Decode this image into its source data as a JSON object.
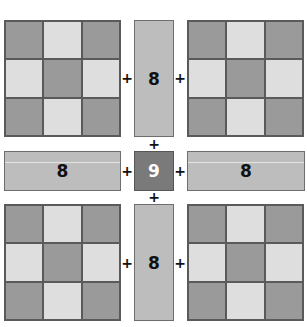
{
  "diagram": {
    "operator": "+",
    "corner_grids": {
      "pattern": [
        [
          "dark",
          "light",
          "dark"
        ],
        [
          "light",
          "dark",
          "light"
        ],
        [
          "dark",
          "light",
          "dark"
        ]
      ]
    },
    "edge_bars": {
      "top": "8",
      "left": "8",
      "right": "8",
      "bottom": "8"
    },
    "center": "9",
    "colors": {
      "dark_cell": "#9a9a9a",
      "light_cell": "#dedede",
      "bar": "#bdbdbd",
      "center": "#7a7a7a",
      "center_text": "#ffffff"
    }
  }
}
